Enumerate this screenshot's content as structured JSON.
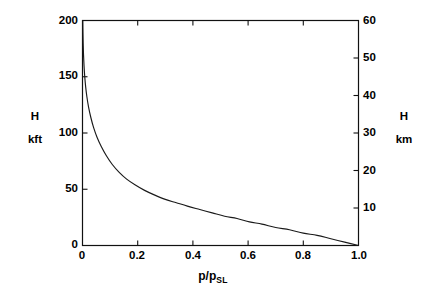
{
  "chart_data": {
    "type": "line",
    "title": "",
    "xlabel": "p/p_SL",
    "ylabel": "H kft",
    "ylabel_right": "H km",
    "xlim": [
      0.0,
      1.0
    ],
    "ylim": [
      0,
      200
    ],
    "ylim_right": [
      0,
      60
    ],
    "grid": false,
    "legend": null,
    "x_ticks": [
      "0",
      "0.2",
      "0.4",
      "0.6",
      "0.8",
      "1.0"
    ],
    "x_tick_values": [
      0.0,
      0.2,
      0.4,
      0.6,
      0.8,
      1.0
    ],
    "y_ticks_left": [
      "0",
      "50",
      "100",
      "150",
      "200"
    ],
    "y_tick_values_left": [
      0,
      50,
      100,
      150,
      200
    ],
    "y_ticks_right": [
      "10",
      "20",
      "30",
      "40",
      "50",
      "60"
    ],
    "y_tick_values_right": [
      10,
      20,
      30,
      40,
      50,
      60
    ],
    "series": [
      {
        "name": "standard-atmosphere-pressure-ratio",
        "x": [
          0.001,
          0.0016,
          0.0024,
          0.0036,
          0.0055,
          0.0082,
          0.0115,
          0.016,
          0.022,
          0.03,
          0.04,
          0.053,
          0.068,
          0.086,
          0.108,
          0.133,
          0.16,
          0.19,
          0.225,
          0.26,
          0.3,
          0.34,
          0.38,
          0.425,
          0.47,
          0.515,
          0.56,
          0.605,
          0.65,
          0.7,
          0.75,
          0.8,
          0.85,
          0.9,
          0.95,
          1.0
        ],
        "y": [
          200,
          190,
          180,
          170,
          160,
          150,
          141,
          132,
          123,
          114,
          105,
          96,
          88,
          80,
          72,
          65,
          59,
          54,
          49,
          45,
          41,
          38,
          35,
          32,
          29,
          26,
          24,
          21,
          19,
          16,
          14,
          11,
          9,
          6,
          3,
          0
        ]
      }
    ]
  },
  "axes": {
    "left_title_line1": "H",
    "left_title_line2": "kft",
    "right_title_line1": "H",
    "right_title_line2": "km",
    "x_axis_label_main": "p/p",
    "x_axis_label_sub": "SL"
  },
  "style": {
    "line_color": "#1a1a1a",
    "axis_color": "#111111",
    "background": "#ffffff"
  }
}
